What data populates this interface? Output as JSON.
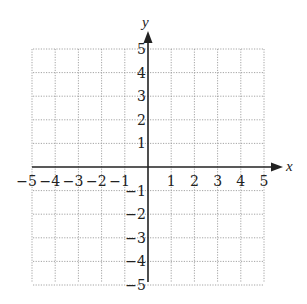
{
  "chart_data": {
    "type": "scatter",
    "title": "",
    "xlabel": "x",
    "ylabel": "y",
    "xlim": [
      -5,
      5
    ],
    "ylim": [
      -5,
      5
    ],
    "grid": true,
    "grid_style": "dotted",
    "x_ticks": [
      -5,
      -4,
      -3,
      -2,
      -1,
      1,
      2,
      3,
      4,
      5
    ],
    "y_ticks": [
      5,
      4,
      3,
      2,
      1,
      -1,
      -2,
      -3,
      -4,
      -5
    ],
    "x_tick_labels": [
      "−5",
      "−4",
      "−3",
      "−2",
      "−1",
      "1",
      "2",
      "3",
      "4",
      "5"
    ],
    "y_tick_labels": [
      "5",
      "4",
      "3",
      "2",
      "1",
      "−1",
      "−2",
      "−3",
      "−4",
      "−5"
    ],
    "series": [],
    "legend": null
  },
  "axes": {
    "x_label": "x",
    "y_label": "y"
  },
  "colors": {
    "axis": "#222222",
    "grid": "#9a9a9a",
    "background": "#ffffff"
  }
}
